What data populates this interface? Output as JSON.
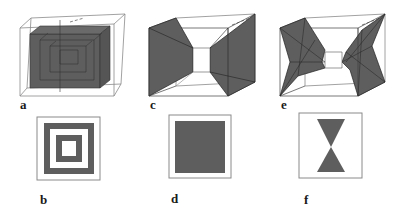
{
  "figure": {
    "panels": [
      {
        "id": "a",
        "label": "a",
        "description": "3D cube with nested concentric shaded boxes"
      },
      {
        "id": "b",
        "label": "b",
        "description": "2D cross-section: concentric square rings"
      },
      {
        "id": "c",
        "label": "c",
        "description": "3D cube with two facing truncated pyramids"
      },
      {
        "id": "d",
        "label": "d",
        "description": "2D cross-section: solid filled square"
      },
      {
        "id": "e",
        "label": "e",
        "description": "3D cube with two facing star-shaped pyramids"
      },
      {
        "id": "f",
        "label": "f",
        "description": "2D cross-section: hourglass (two triangles meeting at apex)"
      }
    ],
    "colors": {
      "fill": "#5e5e5e",
      "fill_light": "#6a6a6a",
      "stroke": "#222222",
      "frame": "#8a8a8a",
      "background": "#ffffff"
    }
  }
}
